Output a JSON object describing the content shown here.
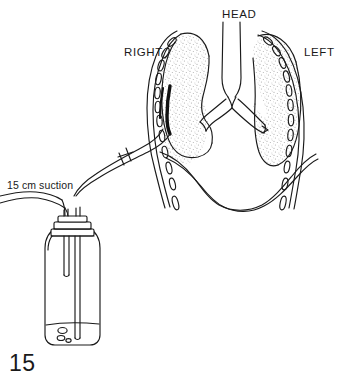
{
  "figure": {
    "number": "15",
    "background_color": "#ffffff",
    "ink_color": "#1a1a1a",
    "lung_fill_color": "#efefef"
  },
  "labels": {
    "head": "HEAD",
    "right": "RIGHT",
    "left": "LEFT",
    "suction": "15 cm suction"
  },
  "anatomy": {
    "parts": [
      "trachea",
      "right-main-bronchus",
      "left-main-bronchus",
      "right-lung",
      "left-lung",
      "diaphragm",
      "rib-cage-right",
      "rib-cage-left"
    ],
    "rib_count_right": 9,
    "rib_count_left": 9
  },
  "apparatus": {
    "parts": [
      "chest-tube",
      "tube-connector",
      "drainage-bottle",
      "bottle-stopper",
      "suction-tube",
      "underwater-seal-tube",
      "water-level",
      "bubbles"
    ],
    "suction_pressure": "15 cm",
    "bubble_count": 3
  }
}
